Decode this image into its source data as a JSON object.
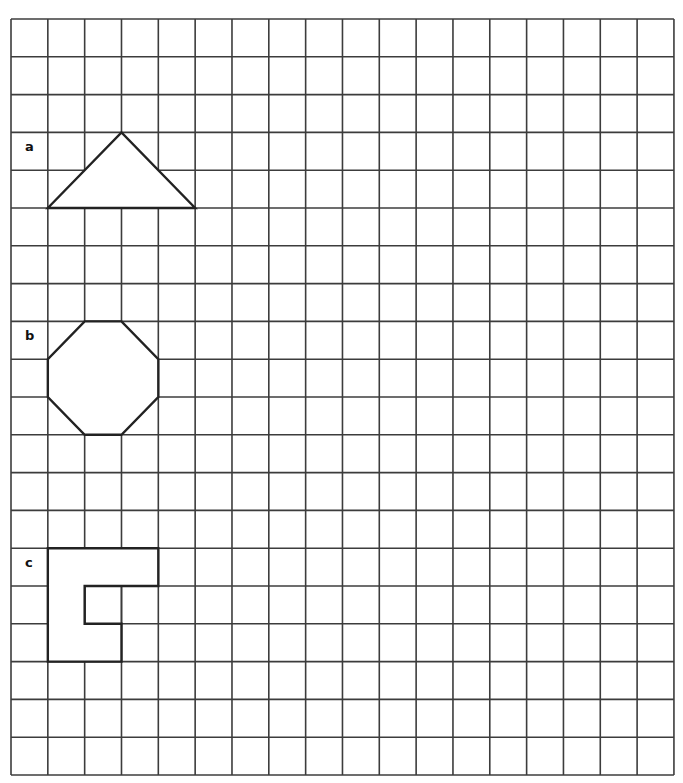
{
  "grid": {
    "cols": 18,
    "rows": 20,
    "left": 11,
    "top": 19,
    "cell_w": 36.83,
    "cell_h": 37.8,
    "line_color": "#3c3c3c",
    "shape_stroke": "#222222"
  },
  "shapes": [
    {
      "label": "a",
      "name": "triangle",
      "label_cell": [
        0,
        3
      ],
      "points": [
        [
          1,
          5
        ],
        [
          3,
          3
        ],
        [
          5,
          5
        ]
      ]
    },
    {
      "label": "b",
      "name": "octagon",
      "label_cell": [
        0,
        8
      ],
      "points": [
        [
          2,
          8
        ],
        [
          3,
          8
        ],
        [
          4,
          9
        ],
        [
          4,
          10
        ],
        [
          3,
          11
        ],
        [
          2,
          11
        ],
        [
          1,
          10
        ],
        [
          1,
          9
        ]
      ]
    },
    {
      "label": "c",
      "name": "c-shape",
      "label_cell": [
        0,
        14
      ],
      "points": [
        [
          1,
          14
        ],
        [
          4,
          14
        ],
        [
          4,
          15
        ],
        [
          2,
          15
        ],
        [
          2,
          16
        ],
        [
          3,
          16
        ],
        [
          3,
          17
        ],
        [
          1,
          17
        ]
      ]
    }
  ]
}
